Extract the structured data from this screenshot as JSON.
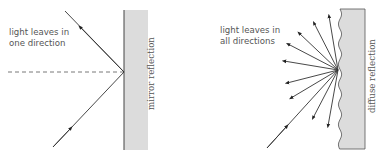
{
  "mirror": {
    "label": "light leaves in",
    "label2": "one direction",
    "surface_label": "mirror reflection"
  },
  "diffuse": {
    "label": "light leaves in",
    "label2": "all directions",
    "surface_label": "diffuse reflection",
    "reflected_ray_count": 9
  },
  "colors": {
    "surface_fill": "#dcdcdc",
    "ray": "#333333",
    "text": "#555555"
  }
}
